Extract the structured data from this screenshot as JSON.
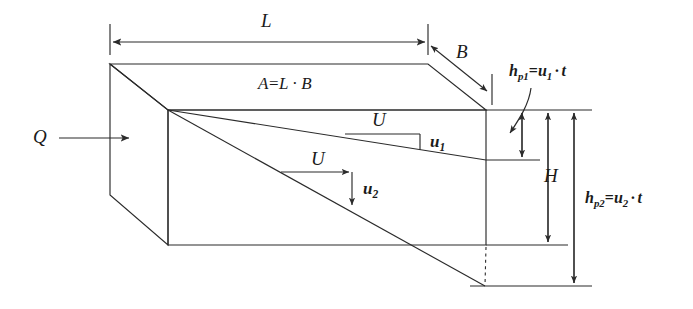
{
  "figure": {
    "stroke_color": "#2b2b2b",
    "background_color": "#ffffff",
    "labels": {
      "inflow": "Q",
      "length": "L",
      "breadth": "B",
      "height": "H",
      "area_equation": {
        "lhs": "A",
        "equals": "=",
        "rhs_first": "L",
        "dot": "·",
        "rhs_second": "B",
        "full": "A=L · B"
      },
      "velocity_upper": "U",
      "velocity_lower": "U",
      "settling_velocity_1": {
        "symbol": "u",
        "subscript": "1",
        "full": "u₁"
      },
      "settling_velocity_2": {
        "symbol": "u",
        "subscript": "2",
        "full": "u₂"
      },
      "settling_depth_1": {
        "symbol": "h",
        "subscript": "p1",
        "equals": "=",
        "velocity": "u",
        "velocity_subscript": "1",
        "dot": "·",
        "time": "t",
        "full": "hₚ₁=u₁ · t"
      },
      "settling_depth_2": {
        "symbol": "h",
        "subscript": "p2",
        "equals": "=",
        "velocity": "u",
        "velocity_subscript": "2",
        "dot": "·",
        "time": "t",
        "full": "hₚ₂=u₂ · t"
      }
    },
    "geometry": {
      "box_top_left": [
        110,
        64
      ],
      "box_top_right": [
        428,
        64
      ],
      "front_top_left": [
        168,
        110
      ],
      "front_top_right": [
        486,
        110
      ],
      "front_bottom_left": [
        168,
        245
      ],
      "front_bottom_right": [
        486,
        245
      ],
      "left_mid": [
        110,
        195
      ],
      "back_right_bottom": [
        486,
        198
      ],
      "trajectory_1_end": [
        486,
        160
      ],
      "trajectory_2_end": [
        485,
        286
      ]
    },
    "dimension_lines": {
      "L_y": 42,
      "L_x_start": 110,
      "L_x_end": 428,
      "B_start": [
        430,
        44
      ],
      "B_end": [
        484,
        90
      ],
      "h_p1_x": 522,
      "h_p1_top": 110,
      "h_p1_bottom": 160,
      "H_x": 548,
      "H_top": 110,
      "H_bottom": 245,
      "h_p2_x": 574,
      "h_p2_top": 110,
      "h_p2_bottom": 286
    }
  }
}
